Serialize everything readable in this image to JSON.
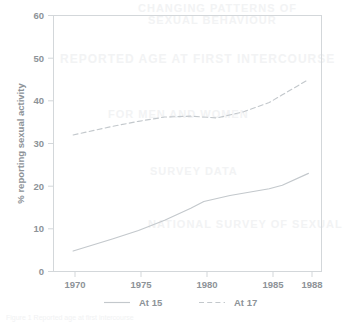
{
  "chart_data": {
    "type": "line",
    "title": "",
    "subtitle": "",
    "xlabel": "",
    "ylabel": "% reporting sexual activity",
    "xlim": [
      1968.5,
      1989.0
    ],
    "ylim": [
      0,
      60
    ],
    "grid": false,
    "legend_position": "bottom",
    "x_ticks": [
      1970,
      1975,
      1980,
      1985,
      1988
    ],
    "x_tick_labels": [
      "1970",
      "1975",
      "1980",
      "1985",
      "1988"
    ],
    "y_ticks": [
      0,
      10,
      20,
      30,
      40,
      50,
      60
    ],
    "y_tick_labels": [
      "0",
      "10",
      "20",
      "30",
      "40",
      "50",
      "60"
    ],
    "series": [
      {
        "name": "At 15",
        "style": "solid",
        "color": "#c3c8cc",
        "x": [
          1970,
          1973,
          1975,
          1977,
          1979,
          1980,
          1982,
          1985,
          1986,
          1988
        ],
        "values": [
          4.8,
          7.6,
          9.6,
          12.0,
          14.8,
          16.4,
          17.8,
          19.4,
          20.2,
          23.0
        ]
      },
      {
        "name": "At 17",
        "style": "dashed",
        "color": "#c3c8cc",
        "x": [
          1970,
          1973,
          1975,
          1977,
          1979,
          1981,
          1983,
          1985,
          1986,
          1988
        ],
        "values": [
          32.0,
          34.0,
          35.2,
          36.2,
          36.4,
          36.0,
          37.4,
          39.6,
          41.4,
          45.0
        ]
      }
    ]
  },
  "axes": {
    "y_title": "% reporting sexual activity"
  },
  "legend": {
    "entries": [
      {
        "label": "At 15",
        "style": "solid"
      },
      {
        "label": "At 17",
        "style": "dashed"
      }
    ]
  },
  "ghost_text": {
    "lines": [
      "CHANGING PATTERNS OF",
      "SEXUAL BEHAVIOUR",
      "REPORTED AGE AT FIRST INTERCOURSE",
      "FOR MEN AND WOMEN",
      "SURVEY DATA",
      "NATIONAL SURVEY OF SEXUAL"
    ]
  },
  "caption": {
    "clipped_line": "Figure 1 Reported age at first intercourse"
  }
}
